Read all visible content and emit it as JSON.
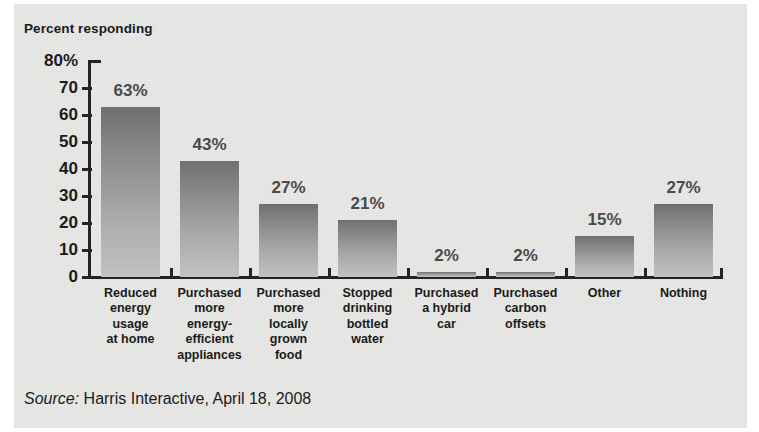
{
  "chart_title": "Percent responding",
  "source": {
    "prefix": "Source:",
    "text": " Harris Interactive, April 18, 2008"
  },
  "colors": {
    "panel_background": "#e9e9e7",
    "page_background": "#ffffff",
    "axis": "#242424",
    "bar_top": "#707070",
    "bar_bottom": "#c2c2c2",
    "text": "#1b1b1b",
    "bar_label_text": "#4a4a4a"
  },
  "axis": {
    "y_tick_labels": [
      "80%",
      "70",
      "60",
      "50",
      "40",
      "30",
      "20",
      "10",
      "0"
    ],
    "y_tick_values": [
      80,
      70,
      60,
      50,
      40,
      30,
      20,
      10,
      0
    ]
  },
  "chart_data": {
    "type": "bar",
    "title": "Percent responding",
    "xlabel": "",
    "ylabel": "Percent responding",
    "ylim": [
      0,
      80
    ],
    "ytick_step": 10,
    "grid": false,
    "legend": "none",
    "orientation": "vertical",
    "categories": [
      "Reduced\nenergy\nusage\nat home",
      "Purchased\nmore\nenergy-\nefficient\nappliances",
      "Purchased\nmore\nlocally\ngrown\nfood",
      "Stopped\ndrinking\nbottled\nwater",
      "Purchased\na hybrid\ncar",
      "Purchased\ncarbon\noffsets",
      "Other",
      "Nothing"
    ],
    "values": [
      63,
      43,
      27,
      21,
      2,
      2,
      15,
      27
    ],
    "value_labels": [
      "63%",
      "43%",
      "27%",
      "21%",
      "2%",
      "2%",
      "15%",
      "27%"
    ],
    "annotations": [
      "Source: Harris Interactive, April 18, 2008"
    ]
  }
}
